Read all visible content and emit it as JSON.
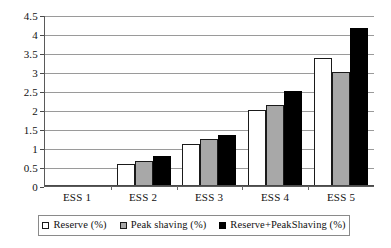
{
  "chart_data": {
    "type": "bar",
    "title": "",
    "subtitle": "",
    "xlabel": "",
    "ylabel": "",
    "categories": [
      "ESS 1",
      "ESS 2",
      "ESS 3",
      "ESS 4",
      "ESS 5"
    ],
    "series": [
      {
        "name": "Reserve (%)",
        "color": "#ffffff",
        "values": [
          0,
          0.58,
          1.1,
          2.0,
          3.38
        ]
      },
      {
        "name": "Peak shaving (%)",
        "color": "#a8a8a8",
        "values": [
          0,
          0.67,
          1.25,
          2.12,
          3.0
        ]
      },
      {
        "name": "Reserve+PeakShaving (%)",
        "color": "#000000",
        "values": [
          0,
          0.78,
          1.35,
          2.5,
          4.17
        ]
      }
    ],
    "ylim": [
      0,
      4.5
    ],
    "y_ticks": [
      0,
      0.5,
      1,
      1.5,
      2,
      2.5,
      3,
      3.5,
      4,
      4.5
    ],
    "y_tick_labels": [
      "0",
      "0.5",
      "1",
      "1.5",
      "2",
      "2.5",
      "3",
      "3.5",
      "4",
      "4.5"
    ],
    "grid": true,
    "legend_position": "bottom",
    "bar_border_color": "#1a1a1a",
    "gridline_color": "#9a9a9a",
    "axis_color": "#4a4a4a"
  },
  "legend": {
    "items": [
      {
        "label": "Reserve (%)"
      },
      {
        "label": "Peak shaving (%)"
      },
      {
        "label": "Reserve+PeakShaving (%)"
      }
    ]
  }
}
